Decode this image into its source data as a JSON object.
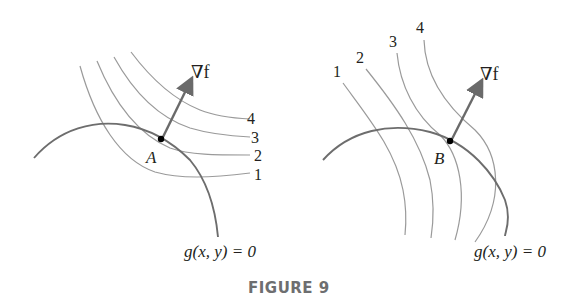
{
  "figure": {
    "caption": "FIGURE 9",
    "panels": [
      {
        "id": "left",
        "point_label": "A",
        "gradient_label": "∇f",
        "constraint_label": "g(x, y) = 0",
        "level_curve_labels": [
          "1",
          "2",
          "3",
          "4"
        ],
        "description": "Level curves of f tangent to constraint at A"
      },
      {
        "id": "right",
        "point_label": "B",
        "gradient_label": "∇f",
        "constraint_label": "g(x, y) = 0",
        "level_curve_labels": [
          "1",
          "2",
          "3",
          "4"
        ],
        "description": "Level curves of f crossing constraint near B"
      }
    ]
  },
  "colors": {
    "level_curve": "#9a9a9a",
    "constraint_curve": "#6d6d6d",
    "gradient_arrow": "#6a6a6a",
    "point": "#000000",
    "caption": "#6d6e70"
  }
}
